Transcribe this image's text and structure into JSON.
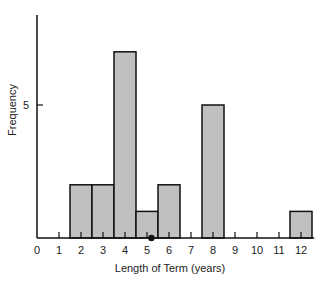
{
  "chart_data": {
    "type": "bar",
    "title": "",
    "xlabel": "Length of Term (years)",
    "ylabel": "Frequency",
    "x_ticks": [
      "0",
      "1",
      "2",
      "3",
      "4",
      "5",
      "6",
      "7",
      "8",
      "9",
      "10",
      "11",
      "12"
    ],
    "y_ticks": [
      {
        "value": 5,
        "label": "5"
      }
    ],
    "categories": [
      "2",
      "3",
      "4",
      "5",
      "6",
      "8",
      "12"
    ],
    "values": [
      2,
      2,
      7,
      1,
      2,
      5,
      1
    ],
    "ylim": [
      0,
      8
    ],
    "xlim": [
      0,
      12.5
    ],
    "grid": false,
    "legend": null,
    "annotations": [
      {
        "type": "dot-marker",
        "x": 5.2,
        "note": "mean marker on x-axis"
      }
    ],
    "colors": {
      "bar_fill": "#c0c0c0",
      "bar_edge": "#111111",
      "axis": "#111111"
    }
  }
}
